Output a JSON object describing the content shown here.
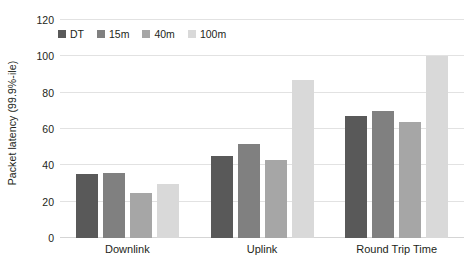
{
  "chart_data": {
    "type": "bar",
    "title": "",
    "subtitle": "",
    "xlabel": "",
    "ylabel": "Packet latency (99.9%-ile)",
    "categories": [
      "Downlink",
      "Uplink",
      "Round Trip Time"
    ],
    "series": [
      {
        "name": "DT",
        "color": "#595959",
        "values": [
          35,
          45,
          67
        ]
      },
      {
        "name": "15m",
        "color": "#808080",
        "values": [
          36,
          52,
          70
        ]
      },
      {
        "name": "40m",
        "color": "#a6a6a6",
        "values": [
          25,
          43,
          64
        ]
      },
      {
        "name": "100m",
        "color": "#d9d9d9",
        "values": [
          30,
          87,
          100
        ]
      }
    ],
    "ylim": [
      0,
      120
    ],
    "yticks": [
      0,
      20,
      40,
      60,
      80,
      100,
      120
    ],
    "ytick_labels": [
      "0",
      "20",
      "40",
      "60",
      "80",
      "100",
      "120"
    ],
    "grid": true,
    "legend_position": "top-left-inside"
  }
}
